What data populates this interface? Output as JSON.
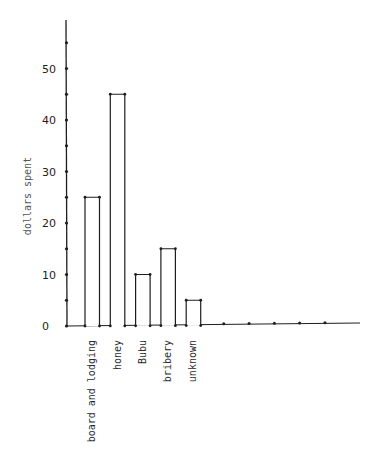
{
  "chart_data": {
    "type": "bar",
    "title": "",
    "xlabel": "",
    "ylabel": "dollars spent",
    "categories": [
      "board and lodging",
      "honey",
      "Bubu",
      "bribery",
      "unknown"
    ],
    "values": [
      25,
      45,
      10,
      15,
      5
    ],
    "ylim": [
      0,
      58
    ],
    "yticks": [
      0,
      10,
      20,
      30,
      40,
      50
    ],
    "minor_yticks": [
      5,
      15,
      25,
      35,
      45,
      55
    ],
    "grid": false,
    "legend": null,
    "bar_fill": "#ffffff",
    "bar_stroke": "#1e1e1e",
    "extra_empty_slots": 5
  }
}
